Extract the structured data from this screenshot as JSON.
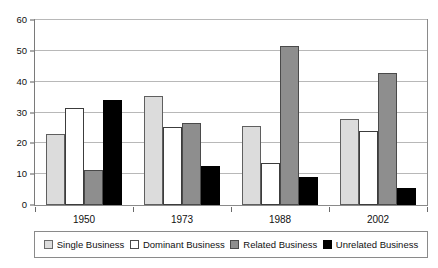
{
  "chart_data": {
    "type": "bar",
    "title": "",
    "subtitle": "",
    "xlabel": "",
    "ylabel": "",
    "categories": [
      "1950",
      "1973",
      "1988",
      "2002"
    ],
    "series": [
      {
        "name": "Single Business",
        "color": "#dcdcdc",
        "values": [
          22.9,
          35.2,
          25.6,
          27.9
        ]
      },
      {
        "name": "Dominant Business",
        "color": "#ffffff",
        "values": [
          31.4,
          25.3,
          13.6,
          24.0
        ]
      },
      {
        "name": "Related Business",
        "color": "#8e8e8e",
        "values": [
          11.4,
          26.7,
          51.5,
          42.7
        ]
      },
      {
        "name": "Unrelated Business",
        "color": "#000000",
        "values": [
          34.2,
          12.7,
          9.2,
          5.4
        ]
      }
    ],
    "ylim": [
      0,
      60
    ],
    "y_ticks": [
      0,
      10,
      20,
      30,
      40,
      50,
      60
    ],
    "y_tick_labels": [
      "0",
      "10",
      "20",
      "30",
      "40",
      "50",
      "60"
    ],
    "x_tick_labels": [
      "1950",
      "1973",
      "1988",
      "2002"
    ],
    "grid": true,
    "grid_axis": "y",
    "legend_position": "bottom",
    "legend_entries": [
      "Single Business",
      "Dominant Business",
      "Related Business",
      "Unrelated Business"
    ]
  }
}
